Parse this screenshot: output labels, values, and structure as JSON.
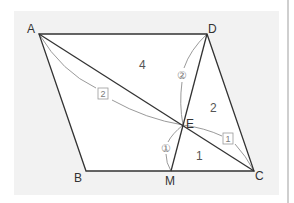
{
  "diagram": {
    "type": "parallelogram-ratio-figure",
    "colors": {
      "panel_background": "#f2f2f2",
      "shape_fill": "#ffffff",
      "edge_stroke": "#333333",
      "curve_stroke": "#9a9a9a",
      "label_text": "#333333",
      "ratio_text": "#7a7a7a",
      "right_rule": "#cfcfcf"
    },
    "vertices": {
      "A": {
        "label": "A",
        "x": 39,
        "y": 34
      },
      "B": {
        "label": "B",
        "x": 86,
        "y": 171
      },
      "C": {
        "label": "C",
        "x": 254,
        "y": 171
      },
      "D": {
        "label": "D",
        "x": 207,
        "y": 34
      },
      "E": {
        "label": "E",
        "x": 183,
        "y": 125
      },
      "M": {
        "label": "M",
        "x": 171,
        "y": 171
      }
    },
    "segments": [
      "AB",
      "BC",
      "CD",
      "DA",
      "AC",
      "DM"
    ],
    "region_labels": [
      {
        "id": "triangle-AED",
        "text": "4"
      },
      {
        "id": "triangle-DEC",
        "text": "2"
      },
      {
        "id": "triangle-EMC",
        "text": "1"
      }
    ],
    "ratio_marks": [
      {
        "id": "AE",
        "text": "2",
        "style": "boxed"
      },
      {
        "id": "EC",
        "text": "1",
        "style": "boxed"
      },
      {
        "id": "DE",
        "text": "②",
        "style": "circled"
      },
      {
        "id": "EM",
        "text": "①",
        "style": "circled"
      }
    ]
  }
}
